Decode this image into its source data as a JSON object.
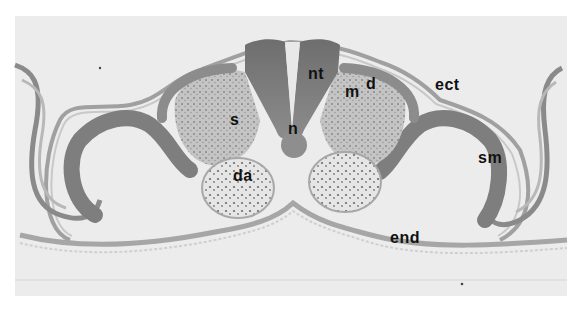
{
  "figure": {
    "type": "histology-micrograph",
    "colors": {
      "background": "#ececec",
      "page": "#ffffff",
      "tissue_dark": "#7a7a7a",
      "tissue_mid": "#a8a8a8",
      "tissue_light": "#d0d0d0",
      "label": "#111111"
    },
    "labels": [
      {
        "id": "nt",
        "text": "nt",
        "meaning": "neural tube"
      },
      {
        "id": "m",
        "text": "m",
        "meaning": "myotome"
      },
      {
        "id": "d",
        "text": "d",
        "meaning": "dermatome"
      },
      {
        "id": "ect",
        "text": "ect",
        "meaning": "ectoderm"
      },
      {
        "id": "s",
        "text": "s",
        "meaning": "sclerotome"
      },
      {
        "id": "n",
        "text": "n",
        "meaning": "notochord"
      },
      {
        "id": "da",
        "text": "da",
        "meaning": "dorsal aorta"
      },
      {
        "id": "sm",
        "text": "sm",
        "meaning": "somatic mesoderm"
      },
      {
        "id": "end",
        "text": "end",
        "meaning": "endoderm"
      }
    ]
  }
}
